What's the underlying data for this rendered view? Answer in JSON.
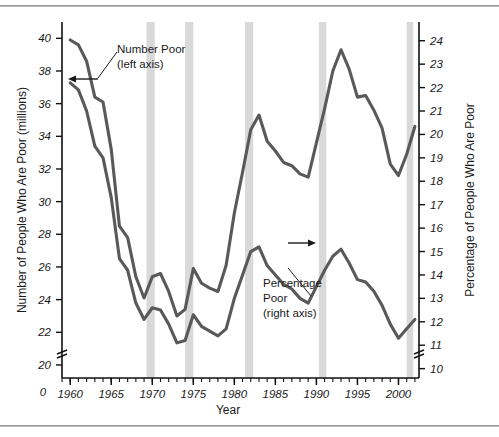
{
  "chart_data": {
    "type": "line",
    "title": "",
    "xlabel": "Year",
    "ylabel": "Number of People Who Are Poor (millions)",
    "y2label": "Percentage of People Who Are Poor",
    "xlim": [
      1959,
      2002.5
    ],
    "ylim": [
      19.2,
      41.0
    ],
    "y2lim": [
      9.6,
      24.8
    ],
    "grid": false,
    "legend_position": "inline-annotations",
    "xticks": [
      1960,
      1965,
      1970,
      1975,
      1980,
      1985,
      1990,
      1995,
      2000
    ],
    "xtick_labels": [
      "1960",
      "1965",
      "1970",
      "1975",
      "1980",
      "1985",
      "1990",
      "1995",
      "2000"
    ],
    "x_origin_label": "0",
    "x_minor_tick_interval": 1,
    "yticks": [
      20,
      22,
      24,
      26,
      28,
      30,
      32,
      34,
      36,
      38,
      40
    ],
    "ytick_labels": [
      "20",
      "22",
      "24",
      "26",
      "28",
      "30",
      "32",
      "34",
      "36",
      "38",
      "40"
    ],
    "y2ticks": [
      10,
      11,
      12,
      13,
      14,
      15,
      16,
      17,
      18,
      19,
      20,
      21,
      22,
      23,
      24
    ],
    "y2tick_labels": [
      "10",
      "11",
      "12",
      "13",
      "14",
      "15",
      "16",
      "17",
      "18",
      "19",
      "20",
      "21",
      "22",
      "23",
      "24"
    ],
    "axis_break_left": true,
    "axis_break_right": true,
    "series": [
      {
        "name": "Number Poor (left axis)",
        "axis": "left",
        "color": "#595959",
        "x": [
          1960,
          1961,
          1962,
          1963,
          1964,
          1965,
          1966,
          1967,
          1968,
          1969,
          1970,
          1971,
          1972,
          1973,
          1974,
          1975,
          1976,
          1977,
          1978,
          1979,
          1980,
          1981,
          1982,
          1983,
          1984,
          1985,
          1986,
          1987,
          1988,
          1989,
          1990,
          1991,
          1992,
          1993,
          1994,
          1995,
          1996,
          1997,
          1998,
          1999,
          2000,
          2001,
          2002
        ],
        "values": [
          39.9,
          39.6,
          38.6,
          36.4,
          36.1,
          33.2,
          28.5,
          27.8,
          25.4,
          24.1,
          25.4,
          25.6,
          24.5,
          23.0,
          23.4,
          25.9,
          25.0,
          24.7,
          24.5,
          26.1,
          29.3,
          31.8,
          34.4,
          35.3,
          33.7,
          33.1,
          32.4,
          32.2,
          31.7,
          31.5,
          33.6,
          35.7,
          38.0,
          39.3,
          38.1,
          36.4,
          36.5,
          35.6,
          34.5,
          32.3,
          31.6,
          32.9,
          34.6
        ],
        "annotation": "Number Poor\n(left axis)"
      },
      {
        "name": "Percentage Poor (right axis)",
        "axis": "right",
        "color": "#595959",
        "x": [
          1960,
          1961,
          1962,
          1963,
          1964,
          1965,
          1966,
          1967,
          1968,
          1969,
          1970,
          1971,
          1972,
          1973,
          1974,
          1975,
          1976,
          1977,
          1978,
          1979,
          1980,
          1981,
          1982,
          1983,
          1984,
          1985,
          1986,
          1987,
          1988,
          1989,
          1990,
          1991,
          1992,
          1993,
          1994,
          1995,
          1996,
          1997,
          1998,
          1999,
          2000,
          2001,
          2002
        ],
        "values": [
          22.2,
          21.9,
          21.0,
          19.5,
          19.0,
          17.3,
          14.7,
          14.2,
          12.8,
          12.1,
          12.6,
          12.5,
          11.9,
          11.1,
          11.2,
          12.3,
          11.8,
          11.6,
          11.4,
          11.7,
          13.0,
          14.0,
          15.0,
          15.2,
          14.4,
          14.0,
          13.6,
          13.4,
          13.0,
          12.8,
          13.5,
          14.2,
          14.8,
          15.1,
          14.5,
          13.8,
          13.7,
          13.3,
          12.7,
          11.9,
          11.3,
          11.7,
          12.1
        ],
        "annotation": "Percentage\nPoor\n(right axis)"
      }
    ],
    "recession_bands": [
      {
        "start": 1969.3,
        "end": 1970.3
      },
      {
        "start": 1974.0,
        "end": 1975.0
      },
      {
        "start": 1981.3,
        "end": 1982.3
      },
      {
        "start": 1990.3,
        "end": 1991.2
      },
      {
        "start": 2001.0,
        "end": 2001.8
      }
    ],
    "recession_color": "#d9d9d9",
    "line_color": "#595959",
    "axis_color": "#111111",
    "background": "#ffffff"
  },
  "annotations": {
    "number_poor": {
      "line1": "Number Poor",
      "line2": "(left axis)"
    },
    "percentage_poor": {
      "line1": "Percentage",
      "line2": "Poor",
      "line3": "(right axis)"
    }
  },
  "axis_titles": {
    "left": "Number of People Who Are Poor (millions)",
    "right": "Percentage of People Who Are Poor",
    "bottom": "Year"
  },
  "origin_label": "0"
}
